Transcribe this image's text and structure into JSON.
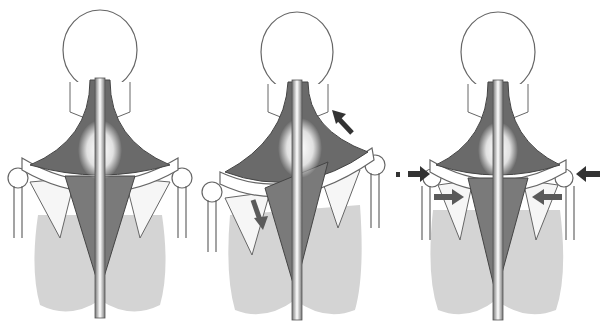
{
  "diagram": {
    "panels": [
      {
        "id": "neutral",
        "label": "",
        "x": 0,
        "arrows": []
      },
      {
        "id": "elevation-upward-rotation",
        "label": "",
        "x": 200,
        "arrows": [
          {
            "name": "arrow-upper-trapezius-elevation",
            "direction": "up-left"
          },
          {
            "name": "arrow-lower-trapezius-depression",
            "direction": "down"
          }
        ]
      },
      {
        "id": "retraction",
        "label": "",
        "x": 408,
        "arrows": [
          {
            "name": "arrow-left-outer-inward",
            "direction": "right"
          },
          {
            "name": "arrow-right-outer-inward",
            "direction": "left"
          },
          {
            "name": "arrow-left-inner-inward",
            "direction": "right"
          },
          {
            "name": "arrow-right-inner-inward",
            "direction": "left"
          }
        ]
      }
    ],
    "colors": {
      "outline": "#555555",
      "muscle_dark": "#6a6a6a",
      "muscle_mid": "#8a8a8a",
      "lung_fill": "#d4d4d4",
      "arrow_dark": "#333333",
      "arrow_mid": "#5a5a5a",
      "background": "#ffffff"
    }
  }
}
